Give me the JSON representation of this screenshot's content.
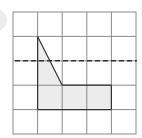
{
  "figure": {
    "grid": {
      "rows": 5,
      "cols": 5,
      "origin_px": [
        13,
        12
      ],
      "cell_px": 24.6,
      "line_color": "#8a8a8a"
    },
    "shape": {
      "vertices_grid": [
        [
          1,
          1
        ],
        [
          2,
          3
        ],
        [
          4,
          3
        ],
        [
          4,
          4
        ],
        [
          1,
          4
        ]
      ],
      "fill_color": "#ececec",
      "stroke_color": "#333333"
    },
    "dashed_line": {
      "orientation": "horizontal",
      "grid_row_line": 2,
      "color": "#333333"
    },
    "decoration": {
      "left_circle_color": "#e6e6e6"
    }
  }
}
